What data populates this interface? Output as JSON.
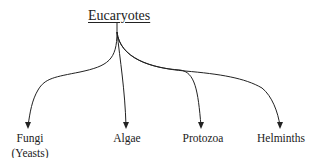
{
  "root": {
    "label": "Eucaryotes"
  },
  "children": [
    {
      "label": "Fungi",
      "sublabel": "(Yeasts)"
    },
    {
      "label": "Algae"
    },
    {
      "label": "Protozoa"
    },
    {
      "label": "Helminths"
    }
  ],
  "colors": {
    "line": "#222222",
    "text": "#222222",
    "background": "#ffffff"
  }
}
